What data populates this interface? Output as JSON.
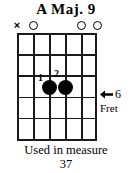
{
  "title": "A Maj. 9",
  "diagram": {
    "type": "guitar-chord-diagram",
    "string_count": 6,
    "fret_space_count": 5,
    "grid": {
      "left": 17,
      "top": 33,
      "width": 80,
      "height": 108,
      "string_spacing": 16,
      "fret_spacing": 21.6,
      "line_color": "#1a1a1a"
    },
    "string_markers": [
      {
        "string": 1,
        "x": 17,
        "symbol": "x",
        "name": "muted",
        "label": "×"
      },
      {
        "string": 2,
        "x": 33,
        "symbol": "o",
        "name": "open",
        "label": ""
      },
      {
        "string": 3,
        "x": 49,
        "symbol": "",
        "name": "none",
        "label": ""
      },
      {
        "string": 4,
        "x": 65,
        "symbol": "",
        "name": "none",
        "label": ""
      },
      {
        "string": 5,
        "x": 81,
        "symbol": "o",
        "name": "open",
        "label": ""
      },
      {
        "string": 6,
        "x": 97,
        "symbol": "o",
        "name": "open",
        "label": ""
      }
    ],
    "finger_dots": [
      {
        "finger": "1",
        "string": 3,
        "fret_space": 3,
        "x": 32,
        "y": 54,
        "num_x": 21,
        "num_y": 40
      },
      {
        "finger": "2",
        "string": 4,
        "fret_space": 3,
        "x": 48,
        "y": 54,
        "num_x": 37,
        "num_y": 36
      }
    ],
    "fret_indicator": {
      "arrow": "left-arrow",
      "number": "6",
      "word": "Fret"
    }
  },
  "caption": {
    "line1": "Used in measure",
    "line2": "37"
  },
  "colors": {
    "ink": "#000000",
    "grid": "#1a1a1a",
    "background": "#ffffff"
  }
}
